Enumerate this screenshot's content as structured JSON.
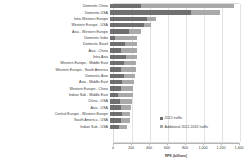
{
  "chart_data": {
    "type": "bar",
    "orientation": "horizontal",
    "title": "",
    "xlabel": "RPK (billions)",
    "ylabel": "",
    "xlim": [
      0,
      1400
    ],
    "grid": true,
    "legend_position": "inside-lower-right",
    "xticks": [
      "0",
      "200",
      "400",
      "600",
      "800",
      "1,000",
      "1,200",
      "1,400"
    ],
    "xtick_values": [
      0,
      200,
      400,
      600,
      800,
      1000,
      1200,
      1400
    ],
    "categories": [
      "Domestic China",
      "Domestic USA",
      "Intra Western Europe",
      "Western Europe - USA",
      "Asia - Western Europe",
      "Domestic India",
      "Domestic Brazil",
      "Asia - China",
      "Intra Asia",
      "Western Europe - Middle East",
      "Western Europe - South America",
      "Domestic Asia",
      "Asia - Middle East",
      "Western Europe - China",
      "Indian Sub - Middle East",
      "China - USA",
      "Asia - USA",
      "Central Europe - Western Europe",
      "South America - USA",
      "Indian Sub - USA"
    ],
    "series": [
      {
        "name": "2012 traffic",
        "color": "#6f6f6f",
        "values": [
          340,
          900,
          410,
          380,
          215,
          60,
          165,
          120,
          175,
          150,
          120,
          155,
          135,
          120,
          85,
          110,
          125,
          130,
          120,
          100
        ]
      },
      {
        "name": "Additional 2012-2032 traffic",
        "color": "#a9a9a9",
        "values": [
          1040,
          320,
          105,
          75,
          125,
          245,
          130,
          180,
          120,
          140,
          165,
          125,
          135,
          140,
          170,
          130,
          110,
          95,
          100,
          85
        ]
      }
    ],
    "totals": [
      1380,
      1220,
      515,
      455,
      340,
      305,
      295,
      300,
      295,
      290,
      285,
      280,
      270,
      260,
      255,
      240,
      235,
      225,
      220,
      185
    ]
  },
  "legend": {
    "items": [
      {
        "label": "2012 traffic"
      },
      {
        "label": "Additional 2012-2032 traffic"
      }
    ]
  }
}
